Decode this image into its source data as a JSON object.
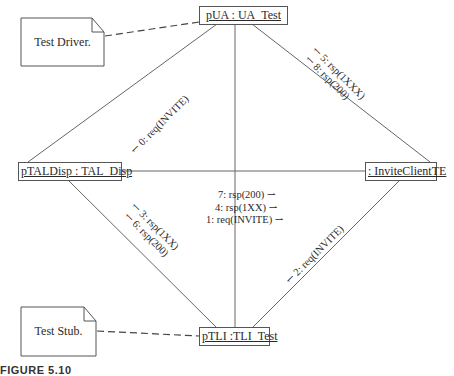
{
  "diagram": {
    "type": "UML collaboration diagram",
    "objects": {
      "pua": "pUA : UA_Test",
      "ptaldisp": "pTALDisp : TAL_Disp",
      "inviteclient": ": InviteClientTE",
      "ptli": "pTLI :TLI_Test"
    },
    "notes": {
      "driver": "Test Driver.",
      "stub": "Test Stub."
    },
    "messages": {
      "m0": "0: req(INVITE)",
      "m5": "5: rsp(1XXX)",
      "m8": "8: rsp(200)",
      "m7": "7: rsp(200)",
      "m4": "4: rsp(1XX)",
      "m1": "1: req(INVITE)",
      "m3": "3: rsp(1XX)",
      "m6": "6: rsp(200)",
      "m2": "2: req(INVITE)"
    },
    "arrow_glyph": "⇀",
    "caption": "FIGURE 5.10"
  }
}
